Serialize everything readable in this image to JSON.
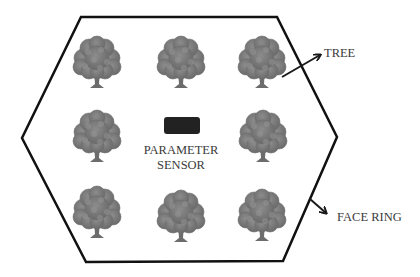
{
  "diagram": {
    "type": "hexagonal-field-layout",
    "boundary": {
      "shape": "hexagon",
      "vertices": [
        [
          81,
          17
        ],
        [
          277,
          17
        ],
        [
          337,
          137
        ],
        [
          283,
          261
        ],
        [
          86,
          262
        ],
        [
          22,
          138
        ]
      ],
      "stroke_color": "#111111",
      "label": "FACE RING"
    },
    "sensor": {
      "label_line1": "PARAMETER",
      "label_line2": "SENSOR",
      "color": "#222222",
      "rect": {
        "x": 164,
        "y": 117,
        "w": 36,
        "h": 17
      }
    },
    "trees": [
      {
        "id": "tree-1",
        "row": 1,
        "col": 1,
        "cx": 97,
        "cy": 57,
        "trunk_bottom": 87
      },
      {
        "id": "tree-2",
        "row": 1,
        "col": 2,
        "cx": 181,
        "cy": 57,
        "trunk_bottom": 88
      },
      {
        "id": "tree-3",
        "row": 1,
        "col": 3,
        "cx": 262,
        "cy": 58,
        "trunk_bottom": 88
      },
      {
        "id": "tree-4",
        "row": 2,
        "col": 1,
        "cx": 97,
        "cy": 132,
        "trunk_bottom": 162
      },
      {
        "id": "tree-6",
        "row": 2,
        "col": 3,
        "cx": 263,
        "cy": 132,
        "trunk_bottom": 162
      },
      {
        "id": "tree-7",
        "row": 3,
        "col": 1,
        "cx": 97,
        "cy": 207,
        "trunk_bottom": 238
      },
      {
        "id": "tree-8",
        "row": 3,
        "col": 2,
        "cx": 181,
        "cy": 210,
        "trunk_bottom": 242
      },
      {
        "id": "tree-9",
        "row": 3,
        "col": 3,
        "cx": 262,
        "cy": 209,
        "trunk_bottom": 241
      }
    ],
    "tree_color": "#7a7a7a",
    "annotations": [
      {
        "id": "tree-annotation",
        "text": "TREE",
        "text_x": 323,
        "text_y": 56,
        "arrow_from": [
          282,
          77
        ],
        "arrow_to": [
          322,
          54
        ]
      },
      {
        "id": "face-ring-annotation",
        "text": "FACE RING",
        "text_x": 337,
        "text_y": 220,
        "arrow_from": [
          310,
          199
        ],
        "arrow_to": [
          328,
          215
        ]
      }
    ]
  }
}
